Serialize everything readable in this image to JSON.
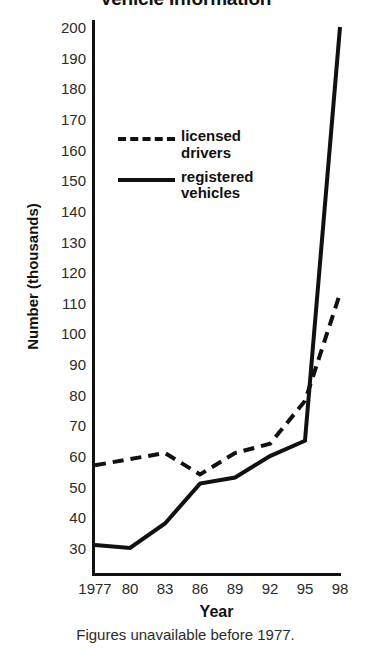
{
  "chart_data": {
    "type": "line",
    "title": "Vehicle Information",
    "xlabel": "Year",
    "ylabel": "Number (thousands)",
    "footnote": "Figures unavailable before 1977.",
    "categories": [
      "1977",
      "80",
      "83",
      "86",
      "89",
      "92",
      "95",
      "98"
    ],
    "x": [
      1977,
      1980,
      1983,
      1986,
      1989,
      1992,
      1995,
      1998
    ],
    "xtick_labels": [
      "1977",
      "80",
      "83",
      "86",
      "89",
      "92",
      "95",
      "98"
    ],
    "ytick_labels": [
      "200",
      "190",
      "180",
      "170",
      "160",
      "150",
      "140",
      "130",
      "120",
      "110",
      "100",
      "90",
      "80",
      "70",
      "60",
      "50",
      "40",
      "30"
    ],
    "ylim": [
      25,
      200
    ],
    "xlim": [
      1977,
      1998
    ],
    "grid": false,
    "legend_position": "upper-left-inside",
    "series": [
      {
        "name": "licensed drivers",
        "style": "dashed",
        "color": "#111111",
        "values": [
          57,
          59,
          61,
          54,
          61,
          64,
          78,
          113
        ]
      },
      {
        "name": "registered vehicles",
        "style": "solid",
        "color": "#111111",
        "values": [
          31,
          30,
          38,
          51,
          53,
          60,
          65,
          200
        ]
      }
    ]
  },
  "legend": {
    "items": [
      {
        "label_line1": "licensed",
        "label_line2": "drivers",
        "style": "dashed"
      },
      {
        "label_line1": "registered",
        "label_line2": "vehicles",
        "style": "solid"
      }
    ]
  },
  "axis": {
    "y_title": "Number (thousands)",
    "x_title": "Year"
  },
  "notes": {
    "footnote": "Figures unavailable before 1977."
  },
  "title": {
    "text": "Vehicle Information"
  }
}
